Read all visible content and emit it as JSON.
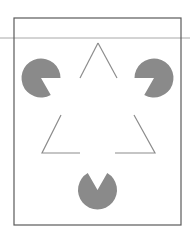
{
  "figure": {
    "width": 190,
    "height": 240,
    "colors": {
      "background": "#ffffff",
      "frame": "#5a5a5a",
      "guide_line": "#a8a8a8",
      "inducer_fill": "#8a8a8a",
      "outline_triangle": "#8c8c8c"
    },
    "guide_line": {
      "x1": 0,
      "y1": 38,
      "x2": 190,
      "y2": 38
    },
    "frame": {
      "x": 14,
      "y": 18,
      "width": 167,
      "height": 207
    },
    "inducers": [
      {
        "name": "top-left",
        "cx": 41,
        "cy": 78,
        "r": 19.5,
        "mouth_start_deg": 0,
        "mouth_end_deg": 60
      },
      {
        "name": "top-right",
        "cx": 154,
        "cy": 78,
        "r": 19.5,
        "mouth_start_deg": 120,
        "mouth_end_deg": 180
      },
      {
        "name": "bottom",
        "cx": 97.5,
        "cy": 190,
        "r": 19.5,
        "mouth_start_deg": 240,
        "mouth_end_deg": 300
      }
    ],
    "outline_segments": [
      {
        "name": "apex-left-leg",
        "points": "80,78 98,43"
      },
      {
        "name": "apex-right-leg",
        "points": "98,43 117,78"
      },
      {
        "name": "bottom-left-corner",
        "points": "61,115 42,153 80,153"
      },
      {
        "name": "bottom-right-corner",
        "points": "115,153 155,153 134,115"
      }
    ]
  }
}
